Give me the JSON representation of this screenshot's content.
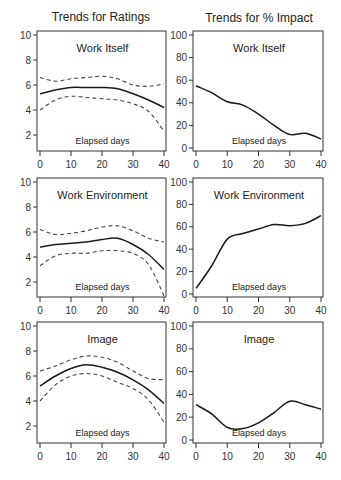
{
  "figure": {
    "column_titles": [
      "Trends for Ratings",
      "Trends for % Impact"
    ],
    "xlabel": "Elapsed days",
    "colors": {
      "line": "#1a1a1a",
      "ci": "#444444",
      "frame": "#333333"
    }
  },
  "chart_data": [
    {
      "type": "line",
      "column": "Trends for Ratings",
      "title": "Work Itself",
      "xlabel": "Elapsed days",
      "ylabel": "",
      "xlim": [
        0,
        40
      ],
      "ylim": [
        1,
        10.3
      ],
      "xticks": [
        0,
        10,
        20,
        30,
        40
      ],
      "yticks": [
        2,
        4,
        6,
        8,
        10
      ],
      "x": [
        0,
        5,
        10,
        15,
        20,
        25,
        30,
        35,
        40
      ],
      "series": [
        {
          "name": "estimate",
          "style": "solid",
          "values": [
            5.3,
            5.6,
            5.8,
            5.8,
            5.8,
            5.7,
            5.3,
            4.8,
            4.2
          ]
        },
        {
          "name": "upper CI",
          "style": "dashed",
          "values": [
            6.6,
            6.3,
            6.5,
            6.6,
            6.7,
            6.5,
            6.0,
            5.9,
            6.1
          ]
        },
        {
          "name": "lower CI",
          "style": "dashed",
          "values": [
            4.0,
            4.8,
            5.1,
            5.0,
            4.9,
            4.8,
            4.5,
            3.9,
            2.3
          ]
        }
      ]
    },
    {
      "type": "line",
      "column": "Trends for % Impact",
      "title": "Work Itself",
      "xlabel": "Elapsed days",
      "ylabel": "",
      "xlim": [
        0,
        40
      ],
      "ylim": [
        -3,
        103
      ],
      "xticks": [
        0,
        10,
        20,
        30,
        40
      ],
      "yticks": [
        0,
        20,
        40,
        60,
        80,
        100
      ],
      "x": [
        0,
        5,
        10,
        15,
        20,
        25,
        30,
        35,
        40
      ],
      "series": [
        {
          "name": "impact",
          "style": "solid",
          "values": [
            55,
            49,
            41,
            38,
            30,
            20,
            12,
            13,
            8
          ]
        }
      ]
    },
    {
      "type": "line",
      "column": "Trends for Ratings",
      "title": "Work Environment",
      "xlabel": "Elapsed days",
      "ylabel": "",
      "xlim": [
        0,
        40
      ],
      "ylim": [
        1,
        10.3
      ],
      "xticks": [
        0,
        10,
        20,
        30,
        40
      ],
      "yticks": [
        2,
        4,
        6,
        8,
        10
      ],
      "x": [
        0,
        5,
        10,
        15,
        20,
        25,
        30,
        35,
        40
      ],
      "series": [
        {
          "name": "estimate",
          "style": "solid",
          "values": [
            4.8,
            5.0,
            5.1,
            5.2,
            5.4,
            5.5,
            5.0,
            4.2,
            3.0
          ]
        },
        {
          "name": "upper CI",
          "style": "dashed",
          "values": [
            6.2,
            5.8,
            5.9,
            6.1,
            6.4,
            6.5,
            6.1,
            5.5,
            5.2
          ]
        },
        {
          "name": "lower CI",
          "style": "dashed",
          "values": [
            3.3,
            4.1,
            4.3,
            4.3,
            4.5,
            4.5,
            4.3,
            3.4,
            0.9
          ]
        }
      ]
    },
    {
      "type": "line",
      "column": "Trends for % Impact",
      "title": "Work Environment",
      "xlabel": "Elapsed days",
      "ylabel": "",
      "xlim": [
        0,
        40
      ],
      "ylim": [
        -3,
        103
      ],
      "xticks": [
        0,
        10,
        20,
        30,
        40
      ],
      "yticks": [
        0,
        20,
        40,
        60,
        80,
        100
      ],
      "x": [
        0,
        5,
        10,
        15,
        20,
        25,
        30,
        35,
        40
      ],
      "series": [
        {
          "name": "impact",
          "style": "solid",
          "values": [
            5,
            25,
            49,
            54,
            58,
            62,
            61,
            63,
            70
          ]
        }
      ]
    },
    {
      "type": "line",
      "column": "Trends for Ratings",
      "title": "Image",
      "xlabel": "Elapsed days",
      "ylabel": "",
      "xlim": [
        0,
        40
      ],
      "ylim": [
        1,
        10.3
      ],
      "xticks": [
        0,
        10,
        20,
        30,
        40
      ],
      "yticks": [
        2,
        4,
        6,
        8,
        10
      ],
      "x": [
        0,
        5,
        10,
        15,
        20,
        25,
        30,
        35,
        40
      ],
      "series": [
        {
          "name": "estimate",
          "style": "solid",
          "values": [
            5.2,
            6.0,
            6.6,
            6.9,
            6.7,
            6.3,
            5.7,
            4.9,
            3.8
          ]
        },
        {
          "name": "upper CI",
          "style": "dashed",
          "values": [
            6.4,
            6.8,
            7.3,
            7.6,
            7.5,
            7.1,
            6.4,
            5.8,
            5.7
          ]
        },
        {
          "name": "lower CI",
          "style": "dashed",
          "values": [
            4.0,
            5.3,
            6.0,
            6.2,
            6.0,
            5.5,
            5.0,
            4.1,
            2.3
          ]
        }
      ]
    },
    {
      "type": "line",
      "column": "Trends for % Impact",
      "title": "Image",
      "xlabel": "Elapsed days",
      "ylabel": "",
      "xlim": [
        0,
        40
      ],
      "ylim": [
        -3,
        103
      ],
      "xticks": [
        0,
        10,
        20,
        30,
        40
      ],
      "yticks": [
        0,
        20,
        40,
        60,
        80,
        100
      ],
      "x": [
        0,
        5,
        10,
        15,
        20,
        25,
        30,
        35,
        40
      ],
      "series": [
        {
          "name": "impact",
          "style": "solid",
          "values": [
            31,
            23,
            11,
            10,
            15,
            24,
            34,
            31,
            27
          ]
        }
      ]
    }
  ]
}
